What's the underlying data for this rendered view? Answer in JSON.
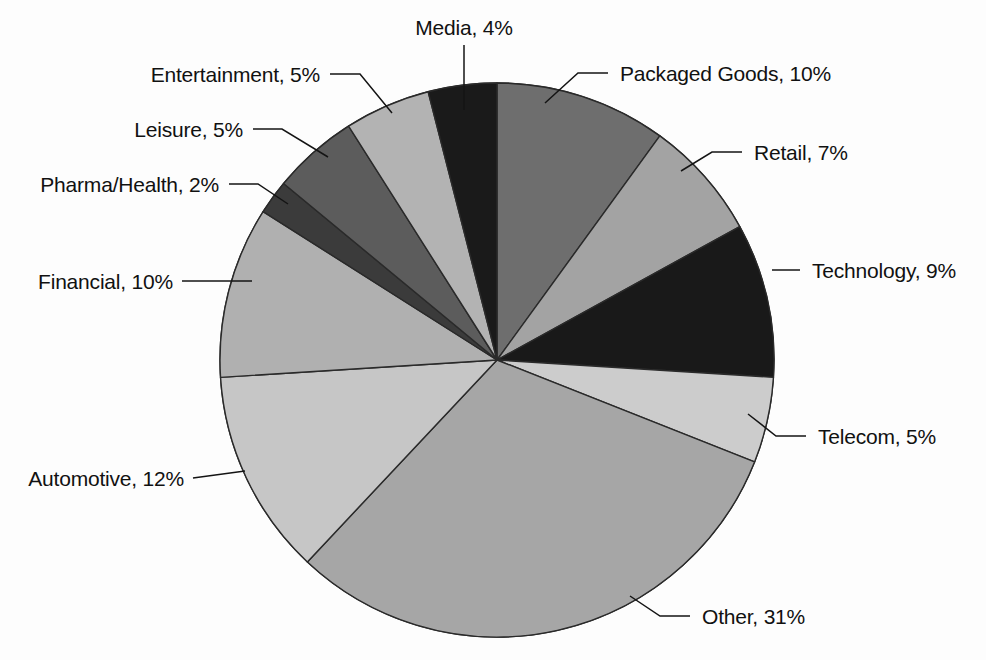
{
  "chart_data": {
    "type": "pie",
    "title": "",
    "subtitle": "",
    "xlabel": "",
    "ylabel": "",
    "legend_position": "none",
    "grid": false,
    "label_format": "{category}, {value}%",
    "start_angle_deg": 0,
    "direction": "clockwise",
    "total": 100,
    "units": "%",
    "categories": [
      "Packaged Goods",
      "Retail",
      "Technology",
      "Telecom",
      "Other",
      "Automotive",
      "Financial",
      "Pharma/Health",
      "Leisure",
      "Entertainment",
      "Media"
    ],
    "values": [
      10,
      7,
      9,
      5,
      31,
      12,
      10,
      2,
      5,
      5,
      4
    ],
    "colors": [
      "#6e6e6e",
      "#a3a3a3",
      "#191919",
      "#cccccc",
      "#a6a6a6",
      "#c6c6c6",
      "#b0b0b0",
      "#3b3b3b",
      "#5c5c5c",
      "#b3b3b3",
      "#1a1a1a"
    ],
    "slices": [
      {
        "label": "Packaged Goods, 10%",
        "category": "Packaged Goods",
        "value": 10,
        "color": "#6e6e6e"
      },
      {
        "label": "Retail, 7%",
        "category": "Retail",
        "value": 7,
        "color": "#a3a3a3"
      },
      {
        "label": "Technology, 9%",
        "category": "Technology",
        "value": 9,
        "color": "#191919"
      },
      {
        "label": "Telecom, 5%",
        "category": "Telecom",
        "value": 5,
        "color": "#cccccc"
      },
      {
        "label": "Other, 31%",
        "category": "Other",
        "value": 31,
        "color": "#a6a6a6"
      },
      {
        "label": "Automotive, 12%",
        "category": "Automotive",
        "value": 12,
        "color": "#c6c6c6"
      },
      {
        "label": "Financial, 10%",
        "category": "Financial",
        "value": 10,
        "color": "#b0b0b0"
      },
      {
        "label": "Pharma/Health, 2%",
        "category": "Pharma/Health",
        "value": 2,
        "color": "#3b3b3b"
      },
      {
        "label": "Leisure, 5%",
        "category": "Leisure",
        "value": 5,
        "color": "#5c5c5c"
      },
      {
        "label": "Entertainment, 5%",
        "category": "Entertainment",
        "value": 5,
        "color": "#b3b3b3"
      },
      {
        "label": "Media, 4%",
        "category": "Media",
        "value": 4,
        "color": "#1a1a1a"
      }
    ]
  },
  "labels": {
    "media": "Media, 4%",
    "entertainment": "Entertainment, 5%",
    "leisure": "Leisure, 5%",
    "pharma_health": "Pharma/Health, 2%",
    "financial": "Financial, 10%",
    "automotive": "Automotive, 12%",
    "packaged_goods": "Packaged Goods, 10%",
    "retail": "Retail, 7%",
    "technology": "Technology, 9%",
    "telecom": "Telecom, 5%",
    "other": "Other, 31%"
  },
  "geometry": {
    "center_x": 497,
    "center_y": 360,
    "radius": 277
  },
  "style": {
    "background": "#fdfdfd",
    "stroke": "#2a2a2a",
    "text_color": "#111111"
  }
}
